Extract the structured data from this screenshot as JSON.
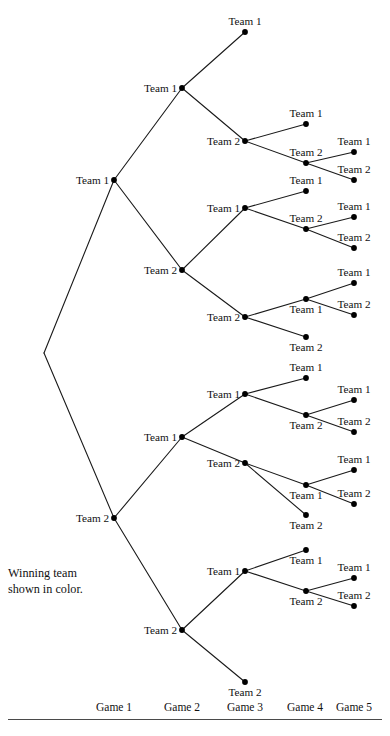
{
  "figure": {
    "title": "",
    "caption_line_1": "Winning team",
    "caption_line_2": "shown in color.",
    "team_1": "Team 1",
    "team_2": "Team 2"
  },
  "axis": {
    "labels": [
      {
        "text": "Game 1",
        "x": 114
      },
      {
        "text": "Game 2",
        "x": 182
      },
      {
        "text": "Game 3",
        "x": 245
      },
      {
        "text": "Game 4",
        "x": 305
      },
      {
        "text": "Game 5",
        "x": 354
      }
    ],
    "label_y": 702,
    "rule_y": 719
  },
  "chart_data": {
    "type": "tree",
    "title": "",
    "xlabel": "",
    "ylabel": "",
    "levels": [
      "Game 1",
      "Game 2",
      "Game 3",
      "Game 4",
      "Game 5"
    ],
    "root": {
      "x": 44,
      "y": 353,
      "label": "",
      "dot": false
    },
    "nodes": [
      {
        "id": "n0",
        "label": "",
        "x": 44,
        "y": 353,
        "dot": false,
        "label_pos": "none"
      },
      {
        "id": "g1a",
        "label": "Team 1",
        "x": 114,
        "y": 180,
        "dot": true,
        "label_pos": "left"
      },
      {
        "id": "g1b",
        "label": "Team 2",
        "x": 114,
        "y": 518,
        "dot": true,
        "label_pos": "left"
      },
      {
        "id": "g2a",
        "label": "Team 1",
        "x": 182,
        "y": 88,
        "dot": true,
        "label_pos": "left"
      },
      {
        "id": "g2b",
        "label": "Team 2",
        "x": 182,
        "y": 270,
        "dot": true,
        "label_pos": "left"
      },
      {
        "id": "g2c",
        "label": "Team 1",
        "x": 182,
        "y": 437,
        "dot": true,
        "label_pos": "left"
      },
      {
        "id": "g2d",
        "label": "Team 2",
        "x": 182,
        "y": 630,
        "dot": true,
        "label_pos": "left"
      },
      {
        "id": "t_g2a_top",
        "label": "Team 1",
        "x": 245,
        "y": 32,
        "dot": true,
        "label_pos": "above"
      },
      {
        "id": "g3a",
        "label": "Team 2",
        "x": 245,
        "y": 141,
        "dot": true,
        "label_pos": "left"
      },
      {
        "id": "g3b",
        "label": "Team 1",
        "x": 245,
        "y": 208,
        "dot": true,
        "label_pos": "left"
      },
      {
        "id": "g3c",
        "label": "Team 2",
        "x": 245,
        "y": 317,
        "dot": true,
        "label_pos": "left"
      },
      {
        "id": "g3d",
        "label": "Team 1",
        "x": 245,
        "y": 394,
        "dot": true,
        "label_pos": "left"
      },
      {
        "id": "g3e",
        "label": "Team 2",
        "x": 245,
        "y": 463,
        "dot": true,
        "label_pos": "left"
      },
      {
        "id": "g3f",
        "label": "Team 1",
        "x": 245,
        "y": 571,
        "dot": true,
        "label_pos": "left"
      },
      {
        "id": "t_g2d_bot",
        "label": "Team 2",
        "x": 245,
        "y": 682,
        "dot": true,
        "label_pos": "below"
      },
      {
        "id": "t_g3a_top",
        "label": "Team 1",
        "x": 306,
        "y": 124,
        "dot": true,
        "label_pos": "above"
      },
      {
        "id": "g4a",
        "label": "Team 2",
        "x": 306,
        "y": 163,
        "dot": true,
        "label_pos": "above"
      },
      {
        "id": "t_g3b_top",
        "label": "Team 1",
        "x": 306,
        "y": 191,
        "dot": true,
        "label_pos": "above"
      },
      {
        "id": "g4b",
        "label": "Team 2",
        "x": 306,
        "y": 229,
        "dot": true,
        "label_pos": "above"
      },
      {
        "id": "g4c",
        "label": "Team 1",
        "x": 306,
        "y": 299,
        "dot": true,
        "label_pos": "below"
      },
      {
        "id": "t_g3c_bot",
        "label": "Team 2",
        "x": 306,
        "y": 337,
        "dot": true,
        "label_pos": "below"
      },
      {
        "id": "t_g3d_top",
        "label": "Team 1",
        "x": 306,
        "y": 378,
        "dot": true,
        "label_pos": "above"
      },
      {
        "id": "g4d",
        "label": "Team 2",
        "x": 306,
        "y": 415,
        "dot": true,
        "label_pos": "below"
      },
      {
        "id": "g4e",
        "label": "Team 1",
        "x": 306,
        "y": 485,
        "dot": true,
        "label_pos": "below"
      },
      {
        "id": "t_g3e_bot",
        "label": "Team 2",
        "x": 306,
        "y": 515,
        "dot": true,
        "label_pos": "below"
      },
      {
        "id": "t_g3f_top",
        "label": "Team 1",
        "x": 306,
        "y": 550,
        "dot": true,
        "label_pos": "below"
      },
      {
        "id": "g4f",
        "label": "Team 2",
        "x": 306,
        "y": 591,
        "dot": true,
        "label_pos": "below"
      },
      {
        "id": "t1",
        "label": "Team 1",
        "x": 354,
        "y": 152,
        "dot": true,
        "label_pos": "above"
      },
      {
        "id": "t2",
        "label": "Team 2",
        "x": 354,
        "y": 180,
        "dot": true,
        "label_pos": "above"
      },
      {
        "id": "t3",
        "label": "Team 1",
        "x": 354,
        "y": 217,
        "dot": true,
        "label_pos": "above"
      },
      {
        "id": "t4",
        "label": "Team 2",
        "x": 354,
        "y": 248,
        "dot": true,
        "label_pos": "above"
      },
      {
        "id": "t5",
        "label": "Team 1",
        "x": 354,
        "y": 283,
        "dot": true,
        "label_pos": "above"
      },
      {
        "id": "t6",
        "label": "Team 2",
        "x": 354,
        "y": 315,
        "dot": true,
        "label_pos": "above"
      },
      {
        "id": "t7",
        "label": "Team 1",
        "x": 354,
        "y": 400,
        "dot": true,
        "label_pos": "above"
      },
      {
        "id": "t8",
        "label": "Team 2",
        "x": 354,
        "y": 432,
        "dot": true,
        "label_pos": "above"
      },
      {
        "id": "t9",
        "label": "Team 1",
        "x": 354,
        "y": 470,
        "dot": true,
        "label_pos": "above"
      },
      {
        "id": "t10",
        "label": "Team 2",
        "x": 354,
        "y": 504,
        "dot": true,
        "label_pos": "above"
      },
      {
        "id": "t11",
        "label": "Team 1",
        "x": 354,
        "y": 578,
        "dot": true,
        "label_pos": "above"
      },
      {
        "id": "t12",
        "label": "Team 2",
        "x": 354,
        "y": 606,
        "dot": true,
        "label_pos": "above"
      }
    ],
    "edges": [
      [
        "n0",
        "g1a"
      ],
      [
        "n0",
        "g1b"
      ],
      [
        "g1a",
        "g2a"
      ],
      [
        "g1a",
        "g2b"
      ],
      [
        "g1b",
        "g2c"
      ],
      [
        "g1b",
        "g2d"
      ],
      [
        "g2a",
        "t_g2a_top"
      ],
      [
        "g2a",
        "g3a"
      ],
      [
        "g2b",
        "g3b"
      ],
      [
        "g2b",
        "g3c"
      ],
      [
        "g2c",
        "g3d"
      ],
      [
        "g2c",
        "g3e"
      ],
      [
        "g2d",
        "g3f"
      ],
      [
        "g2d",
        "t_g2d_bot"
      ],
      [
        "g3a",
        "t_g3a_top"
      ],
      [
        "g3a",
        "g4a"
      ],
      [
        "g3b",
        "t_g3b_top"
      ],
      [
        "g3b",
        "g4b"
      ],
      [
        "g3c",
        "g4c"
      ],
      [
        "g3c",
        "t_g3c_bot"
      ],
      [
        "g3d",
        "t_g3d_top"
      ],
      [
        "g3d",
        "g4d"
      ],
      [
        "g3e",
        "g4e"
      ],
      [
        "g3e",
        "t_g3e_bot"
      ],
      [
        "g3f",
        "t_g3f_top"
      ],
      [
        "g3f",
        "g4f"
      ],
      [
        "g4a",
        "t1"
      ],
      [
        "g4a",
        "t2"
      ],
      [
        "g4b",
        "t3"
      ],
      [
        "g4b",
        "t4"
      ],
      [
        "g4c",
        "t5"
      ],
      [
        "g4c",
        "t6"
      ],
      [
        "g4d",
        "t7"
      ],
      [
        "g4d",
        "t8"
      ],
      [
        "g4e",
        "t9"
      ],
      [
        "g4e",
        "t10"
      ],
      [
        "g4f",
        "t11"
      ],
      [
        "g4f",
        "t12"
      ]
    ],
    "style": {
      "line_color": "#1a1a1a",
      "dot_color": "#000000",
      "text_color": "#111111",
      "background": "#ffffff"
    }
  }
}
